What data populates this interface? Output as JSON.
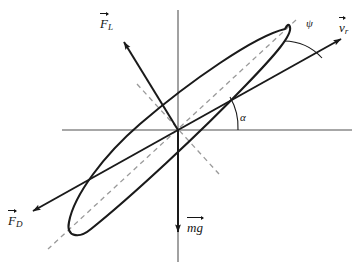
{
  "figure": {
    "background_color": "#ffffff",
    "axis_color": "#808080",
    "stroke_color": "#1a1a1a",
    "dash_color": "#8c8c8c"
  },
  "axes": {
    "horizontal_label": "",
    "vertical_label": "",
    "origin": {
      "x": 178,
      "y": 130
    }
  },
  "vectors": [
    {
      "id": "lift",
      "symbol": "F",
      "subscript": "L",
      "label": "F_L",
      "name": "lift-force-vector",
      "tip": {
        "x": 122,
        "y": 40
      },
      "label_pos": {
        "x": 100,
        "y": 18
      }
    },
    {
      "id": "drag",
      "symbol": "F",
      "subscript": "D",
      "label": "F_D",
      "name": "drag-force-vector",
      "tip": {
        "x": 30,
        "y": 212
      },
      "label_pos": {
        "x": 8,
        "y": 215
      }
    },
    {
      "id": "relative-velocity",
      "symbol": "v",
      "subscript": "r",
      "label": "v_r",
      "name": "relative-velocity-vector",
      "tip": {
        "x": 345,
        "y": 37
      },
      "label_pos": {
        "x": 340,
        "y": 22
      }
    },
    {
      "id": "weight",
      "symbol": "mg",
      "subscript": "",
      "label": "mg",
      "name": "weight-vector",
      "tip": {
        "x": 178,
        "y": 235
      },
      "label_pos": {
        "x": 187,
        "y": 222
      }
    }
  ],
  "angles": [
    {
      "id": "alpha",
      "glyph": "α",
      "name": "angle-of-attack-alpha",
      "label_pos": {
        "x": 241,
        "y": 113
      },
      "between": "horizontal-axis and relative-velocity-vector"
    },
    {
      "id": "psi",
      "glyph": "ψ",
      "name": "inclination-angle-psi",
      "label_pos": {
        "x": 307,
        "y": 19
      },
      "between": "chord-line and relative-velocity-vector"
    }
  ],
  "airfoil": {
    "name": "airfoil-body",
    "tilt_degrees": 37,
    "leading_edge": {
      "x": 287,
      "y": 30
    },
    "trailing_edge": {
      "x": 70,
      "y": 230
    },
    "chord_line_style": "dashed"
  }
}
